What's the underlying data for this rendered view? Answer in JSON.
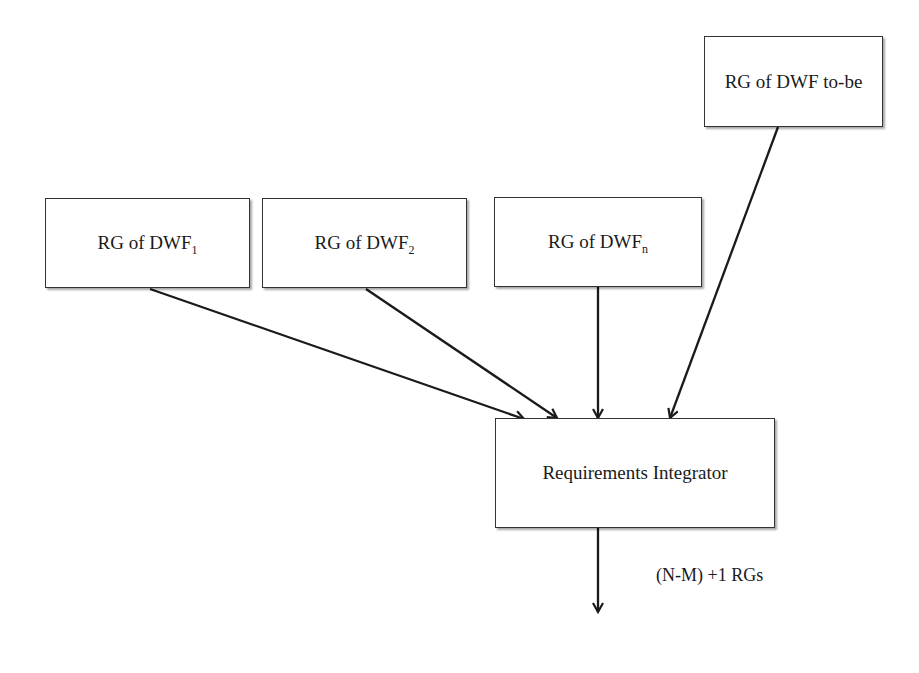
{
  "diagram": {
    "type": "flow",
    "nodes": [
      {
        "id": "rg1",
        "label": "RG of DWF",
        "subscript": "1"
      },
      {
        "id": "rg2",
        "label": "RG of DWF",
        "subscript": "2"
      },
      {
        "id": "rgn",
        "label": "RG of DWF",
        "subscript": "n"
      },
      {
        "id": "rgtobe",
        "label": "RG of DWF to-be"
      },
      {
        "id": "integrator",
        "label": "Requirements Integrator"
      }
    ],
    "edges": [
      {
        "from": "rg1",
        "to": "integrator"
      },
      {
        "from": "rg2",
        "to": "integrator"
      },
      {
        "from": "rgn",
        "to": "integrator"
      },
      {
        "from": "rgtobe",
        "to": "integrator"
      },
      {
        "from": "integrator",
        "to": "output",
        "label": "(N-M) +1 RGs"
      }
    ],
    "output_label": "(N-M) +1 RGs"
  },
  "colors": {
    "stroke": "#1a1a1a",
    "box_border": "#333333",
    "background": "#ffffff"
  }
}
